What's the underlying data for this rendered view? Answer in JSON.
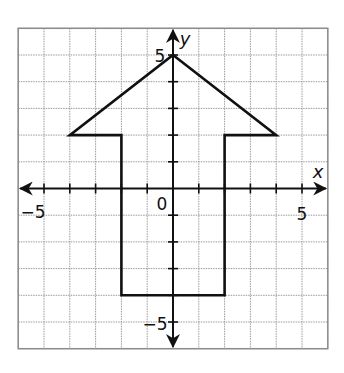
{
  "chart_data": {
    "type": "line",
    "title": "",
    "xlabel": "x",
    "ylabel": "y",
    "xlim": [
      -6,
      6
    ],
    "ylim": [
      -6,
      6
    ],
    "grid": true,
    "grid_step": 1,
    "tick_labels": {
      "x": [
        {
          "value": -5,
          "label": "−5"
        },
        {
          "value": 5,
          "label": "5"
        }
      ],
      "y": [
        {
          "value": 5,
          "label": "5"
        },
        {
          "value": -5,
          "label": "−5"
        }
      ],
      "origin": "0"
    },
    "series": [
      {
        "name": "arrow-polygon",
        "closed": true,
        "points": [
          [
            0,
            5
          ],
          [
            4,
            2
          ],
          [
            2,
            2
          ],
          [
            2,
            -4
          ],
          [
            -2,
            -4
          ],
          [
            -2,
            2
          ],
          [
            -4,
            2
          ]
        ]
      }
    ]
  },
  "labels": {
    "x_axis": "x",
    "y_axis": "y",
    "origin": "0",
    "x_neg5": "−5",
    "x_pos5": "5",
    "y_pos5": "5",
    "y_neg5": "−5"
  }
}
